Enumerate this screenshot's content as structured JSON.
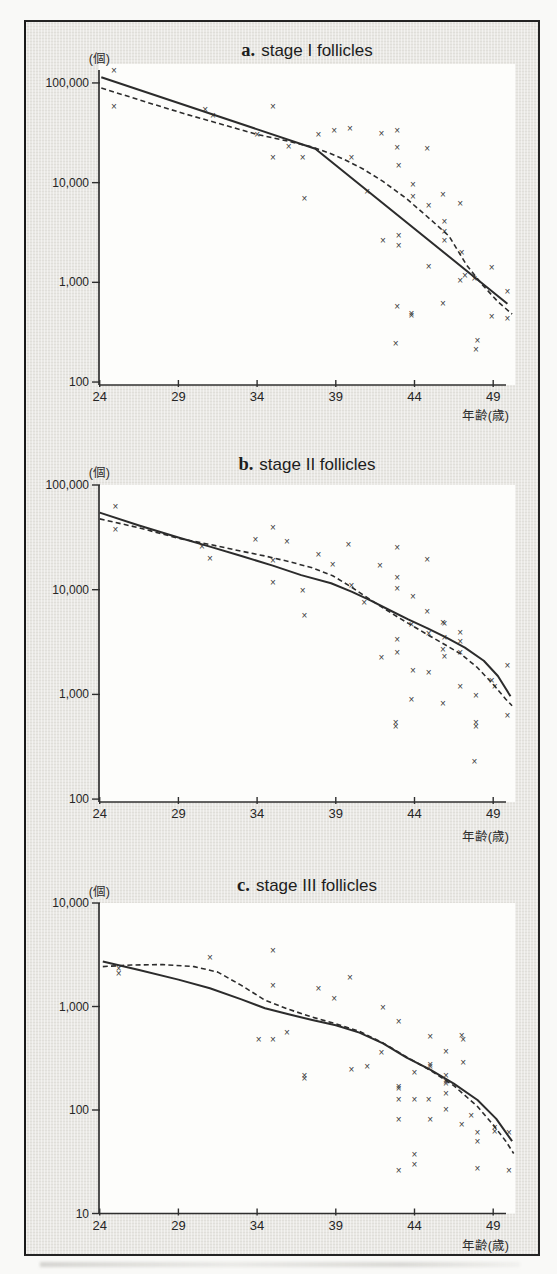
{
  "page": {
    "paper_color": "#f9f9f7",
    "panel_bg": "#e9e8e4",
    "plot_bg": "#fdfdfb",
    "frame_border": "#232323",
    "ink": "#2c2c2c",
    "marker_glyph": "×"
  },
  "panels": [
    {
      "key": "a",
      "title_prefix": "a.",
      "title": "stage I follicles",
      "y_unit": "(個)",
      "x_unit": "年齢(歳)"
    },
    {
      "key": "b",
      "title_prefix": "b.",
      "title": "stage II follicles",
      "y_unit": "(個)",
      "x_unit": "年齢(歳)"
    },
    {
      "key": "c",
      "title_prefix": "c.",
      "title": "stage III follicles",
      "y_unit": "(個)",
      "x_unit": "年齢(歳)"
    }
  ],
  "chart_data": [
    {
      "type": "scatter",
      "title": "a. stage I follicles",
      "xlabel": "年齢(歳)",
      "ylabel": "(個)",
      "y_scale": "log",
      "x_ticks": [
        24,
        29,
        34,
        39,
        44,
        49
      ],
      "xlim": [
        24,
        50.4
      ],
      "ylim": [
        95,
        155000
      ],
      "y_ticks": [
        {
          "v": 100000,
          "label": "100,000"
        },
        {
          "v": 10000,
          "label": "10,000"
        },
        {
          "v": 1000,
          "label": "1,000"
        },
        {
          "v": 100,
          "label": "100"
        }
      ],
      "marker": "×",
      "points": [
        [
          24.9,
          134000
        ],
        [
          24.9,
          58000
        ],
        [
          30.7,
          54000
        ],
        [
          31.2,
          47000
        ],
        [
          34.0,
          30000
        ],
        [
          35.0,
          58000
        ],
        [
          35.0,
          18000
        ],
        [
          36.0,
          23000
        ],
        [
          36.9,
          17700
        ],
        [
          37.0,
          6900
        ],
        [
          37.9,
          30000
        ],
        [
          38.9,
          33500
        ],
        [
          39.9,
          35000
        ],
        [
          40.0,
          17800
        ],
        [
          41.0,
          8200
        ],
        [
          41.9,
          31000
        ],
        [
          42.0,
          2600
        ],
        [
          42.9,
          33500
        ],
        [
          42.9,
          22400
        ],
        [
          43.0,
          14700
        ],
        [
          43.0,
          2950
        ],
        [
          43.0,
          2350
        ],
        [
          42.9,
          575
        ],
        [
          42.8,
          245
        ],
        [
          43.9,
          9600
        ],
        [
          43.9,
          7200
        ],
        [
          43.8,
          490
        ],
        [
          43.8,
          462
        ],
        [
          44.8,
          22000
        ],
        [
          44.9,
          5900
        ],
        [
          44.9,
          1430
        ],
        [
          45.8,
          7600
        ],
        [
          45.9,
          4050
        ],
        [
          45.9,
          3230
        ],
        [
          45.9,
          2650
        ],
        [
          45.8,
          615
        ],
        [
          46.9,
          6200
        ],
        [
          47.0,
          2000
        ],
        [
          46.9,
          1050
        ],
        [
          47.2,
          1180
        ],
        [
          47.8,
          1080
        ],
        [
          47.9,
          210
        ],
        [
          48.0,
          260
        ],
        [
          48.9,
          1400
        ],
        [
          48.9,
          450
        ],
        [
          49.9,
          810
        ],
        [
          49.9,
          435
        ]
      ],
      "fit_lines": [
        {
          "name": "segmented linear fit",
          "style": "solid",
          "points": [
            [
              24.1,
              114000
            ],
            [
              37.7,
              21900
            ],
            [
              49.9,
              610
            ]
          ]
        },
        {
          "name": "smooth curve fit",
          "style": "dashed",
          "points": [
            [
              24.1,
              89000
            ],
            [
              27,
              64000
            ],
            [
              29.5,
              48500
            ],
            [
              32,
              37500
            ],
            [
              34,
              30500
            ],
            [
              36,
              26000
            ],
            [
              37.5,
              22800
            ],
            [
              38.6,
              19800
            ],
            [
              39.5,
              17200
            ],
            [
              40.7,
              13800
            ],
            [
              42,
              10300
            ],
            [
              43.5,
              6900
            ],
            [
              45,
              4300
            ],
            [
              46.2,
              2900
            ],
            [
              47.3,
              1500
            ],
            [
              48.3,
              950
            ],
            [
              49.3,
              640
            ],
            [
              50.2,
              480
            ]
          ]
        }
      ]
    },
    {
      "type": "scatter",
      "title": "b. stage II follicles",
      "xlabel": "年齢(歳)",
      "ylabel": "(個)",
      "y_scale": "log",
      "x_ticks": [
        24,
        29,
        34,
        39,
        44,
        49
      ],
      "xlim": [
        24,
        50.4
      ],
      "ylim": [
        100,
        100000
      ],
      "y_ticks": [
        {
          "v": 100000,
          "label": "100,000"
        },
        {
          "v": 10000,
          "label": "10,000"
        },
        {
          "v": 1000,
          "label": "1,000"
        },
        {
          "v": 100,
          "label": "100"
        }
      ],
      "marker": "×",
      "points": [
        [
          25.0,
          62000
        ],
        [
          25.0,
          37600
        ],
        [
          30.5,
          26000
        ],
        [
          31.0,
          20000
        ],
        [
          33.9,
          30000
        ],
        [
          35.0,
          39000
        ],
        [
          35.0,
          19000
        ],
        [
          35.0,
          11700
        ],
        [
          35.9,
          28800
        ],
        [
          36.9,
          9800
        ],
        [
          37.0,
          5600
        ],
        [
          37.9,
          21500
        ],
        [
          38.8,
          17300
        ],
        [
          39.8,
          26800
        ],
        [
          40.0,
          10900
        ],
        [
          40.8,
          7600
        ],
        [
          41.8,
          16900
        ],
        [
          41.9,
          2240
        ],
        [
          42.9,
          25500
        ],
        [
          42.9,
          13100
        ],
        [
          42.9,
          10200
        ],
        [
          42.9,
          3330
        ],
        [
          42.9,
          2530
        ],
        [
          42.8,
          540
        ],
        [
          42.8,
          498
        ],
        [
          43.9,
          8500
        ],
        [
          43.8,
          4650
        ],
        [
          43.9,
          1670
        ],
        [
          43.8,
          885
        ],
        [
          44.8,
          19600
        ],
        [
          44.8,
          6200
        ],
        [
          44.9,
          3800
        ],
        [
          44.9,
          1630
        ],
        [
          45.8,
          4900
        ],
        [
          45.9,
          4700
        ],
        [
          45.9,
          3470
        ],
        [
          45.8,
          2690
        ],
        [
          45.9,
          2290
        ],
        [
          45.8,
          820
        ],
        [
          46.9,
          3900
        ],
        [
          46.9,
          3160
        ],
        [
          46.9,
          2530
        ],
        [
          46.9,
          1200
        ],
        [
          47.9,
          980
        ],
        [
          47.9,
          540
        ],
        [
          47.9,
          498
        ],
        [
          47.8,
          230
        ],
        [
          48.9,
          1350
        ],
        [
          49.1,
          1200
        ],
        [
          49.9,
          1900
        ],
        [
          49.9,
          630
        ]
      ],
      "fit_lines": [
        {
          "name": "segmented linear fit",
          "style": "solid",
          "points": [
            [
              24,
              54500
            ],
            [
              26.5,
              41000
            ],
            [
              29,
              31500
            ],
            [
              31,
              25800
            ],
            [
              33,
              21000
            ],
            [
              35,
              17000
            ],
            [
              36.8,
              13800
            ],
            [
              38.7,
              11500
            ],
            [
              40,
              9600
            ],
            [
              41.2,
              7900
            ],
            [
              42.4,
              6400
            ],
            [
              43.6,
              5200
            ],
            [
              44.8,
              4300
            ],
            [
              46,
              3500
            ],
            [
              47.2,
              2800
            ],
            [
              48.4,
              2100
            ],
            [
              49.3,
              1500
            ],
            [
              50.1,
              960
            ]
          ]
        },
        {
          "name": "smooth curve fit",
          "style": "dashed",
          "points": [
            [
              24,
              47500
            ],
            [
              26.5,
              39000
            ],
            [
              29,
              31000
            ],
            [
              31,
              27000
            ],
            [
              33,
              23300
            ],
            [
              34.5,
              21000
            ],
            [
              36,
              18600
            ],
            [
              37.5,
              16200
            ],
            [
              38.8,
              13600
            ],
            [
              40,
              10600
            ],
            [
              41,
              8400
            ],
            [
              42,
              6700
            ],
            [
              43,
              5400
            ],
            [
              44,
              4400
            ],
            [
              45,
              3600
            ],
            [
              46,
              2950
            ],
            [
              47,
              2400
            ],
            [
              48,
              1800
            ],
            [
              49,
              1250
            ],
            [
              49.8,
              900
            ],
            [
              50.2,
              780
            ]
          ]
        }
      ]
    },
    {
      "type": "scatter",
      "title": "c. stage III follicles",
      "xlabel": "年齢(歳)",
      "ylabel": "(個)",
      "y_scale": "log",
      "x_ticks": [
        24,
        29,
        34,
        39,
        44,
        49
      ],
      "xlim": [
        24,
        50.4
      ],
      "ylim": [
        10,
        10000
      ],
      "y_ticks": [
        {
          "v": 10000,
          "label": "10,000"
        },
        {
          "v": 1000,
          "label": "1,000"
        },
        {
          "v": 100,
          "label": "100"
        },
        {
          "v": 10,
          "label": "10"
        }
      ],
      "marker": "×",
      "points": [
        [
          25.2,
          2340
        ],
        [
          25.2,
          2090
        ],
        [
          31.0,
          3000
        ],
        [
          34.1,
          480
        ],
        [
          35.0,
          3500
        ],
        [
          35.0,
          1600
        ],
        [
          35.0,
          480
        ],
        [
          35.9,
          560
        ],
        [
          37.0,
          215
        ],
        [
          37.0,
          200
        ],
        [
          37.9,
          1500
        ],
        [
          38.9,
          1180
        ],
        [
          39.9,
          1900
        ],
        [
          40.0,
          245
        ],
        [
          41.0,
          265
        ],
        [
          42.0,
          980
        ],
        [
          41.9,
          355
        ],
        [
          43.0,
          720
        ],
        [
          43.0,
          170
        ],
        [
          43.0,
          160
        ],
        [
          43.0,
          127
        ],
        [
          43.0,
          81
        ],
        [
          43.0,
          26
        ],
        [
          44.0,
          230
        ],
        [
          44.0,
          127
        ],
        [
          44.0,
          37
        ],
        [
          44.0,
          30
        ],
        [
          45.0,
          510
        ],
        [
          45.0,
          275
        ],
        [
          45.0,
          260
        ],
        [
          44.9,
          127
        ],
        [
          45.0,
          81
        ],
        [
          46.0,
          365
        ],
        [
          46.0,
          215
        ],
        [
          46.0,
          190
        ],
        [
          46.0,
          180
        ],
        [
          46.0,
          144
        ],
        [
          46.0,
          102
        ],
        [
          47.0,
          525
        ],
        [
          47.1,
          480
        ],
        [
          47.1,
          285
        ],
        [
          47.0,
          72
        ],
        [
          47.6,
          88
        ],
        [
          48.0,
          61
        ],
        [
          48.0,
          50
        ],
        [
          48.0,
          27
        ],
        [
          49.1,
          68
        ],
        [
          49.1,
          62
        ],
        [
          50.0,
          60
        ],
        [
          50.0,
          26
        ]
      ],
      "fit_lines": [
        {
          "name": "segmented linear fit",
          "style": "solid",
          "points": [
            [
              24.2,
              2720
            ],
            [
              26.5,
              2250
            ],
            [
              29,
              1820
            ],
            [
              31,
              1500
            ],
            [
              33,
              1170
            ],
            [
              34.5,
              960
            ],
            [
              36,
              840
            ],
            [
              37.5,
              740
            ],
            [
              39,
              660
            ],
            [
              40.5,
              560
            ],
            [
              42,
              440
            ],
            [
              43.5,
              320
            ],
            [
              45,
              245
            ],
            [
              46.5,
              180
            ],
            [
              48,
              125
            ],
            [
              49.2,
              82
            ],
            [
              50.2,
              50
            ]
          ]
        },
        {
          "name": "smooth curve fit",
          "style": "dashed",
          "points": [
            [
              24.2,
              2430
            ],
            [
              26,
              2520
            ],
            [
              28,
              2540
            ],
            [
              30,
              2430
            ],
            [
              31.5,
              2150
            ],
            [
              33,
              1600
            ],
            [
              34.5,
              1150
            ],
            [
              36,
              940
            ],
            [
              37.5,
              790
            ],
            [
              39,
              680
            ],
            [
              40.5,
              575
            ],
            [
              42,
              445
            ],
            [
              43.5,
              325
            ],
            [
              45,
              242
            ],
            [
              46.5,
              172
            ],
            [
              48,
              108
            ],
            [
              49,
              72
            ],
            [
              49.8,
              50
            ],
            [
              50.3,
              38
            ]
          ]
        }
      ]
    }
  ]
}
